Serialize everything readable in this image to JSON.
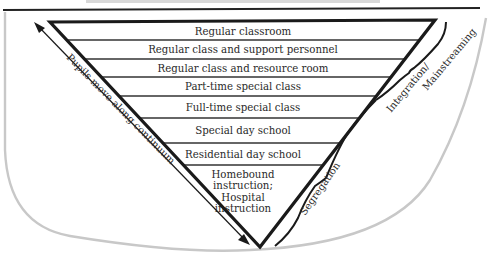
{
  "diagram": {
    "type": "inverted-triangle-continuum",
    "caption_fragment": "",
    "tiers": [
      {
        "label": [
          "Regular classroom"
        ]
      },
      {
        "label": [
          "Regular class and support personnel"
        ]
      },
      {
        "label": [
          "Regular class and resource room"
        ]
      },
      {
        "label": [
          "Part-time special class"
        ]
      },
      {
        "label": [
          "Full-time special class"
        ]
      },
      {
        "label": [
          "Special day school"
        ]
      },
      {
        "label": [
          "Residential day school"
        ]
      },
      {
        "label": [
          "Homebound",
          "instruction;",
          "Hospital",
          "instruction"
        ]
      }
    ],
    "left_arrow_label": "Pupils move along continuum",
    "brackets": {
      "upper": {
        "label_line1": "Integration/",
        "label_line2": "Mainstreaming"
      },
      "lower": {
        "label": "Segregation"
      }
    },
    "colors": {
      "line": "#1a1a1a",
      "rule": "#333333",
      "text": "#2a2a2a",
      "background_outline": "#c8c8c8",
      "caption_bar": "#d8d8d8"
    }
  }
}
